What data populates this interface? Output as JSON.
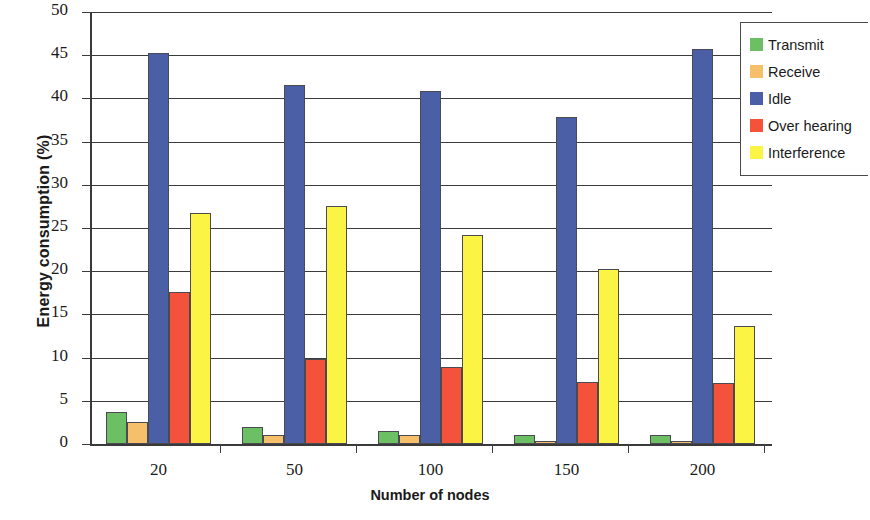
{
  "chart_data": {
    "type": "bar",
    "title": "",
    "xlabel": "Number of nodes",
    "ylabel": "Energy consumption (%)",
    "categories": [
      "20",
      "50",
      "100",
      "150",
      "200"
    ],
    "ylim": [
      0,
      50
    ],
    "yticks": [
      "0",
      "5",
      "10",
      "15",
      "20",
      "25",
      "30",
      "35",
      "40",
      "45",
      "50"
    ],
    "grid": true,
    "legend_position": "top-right",
    "series": [
      {
        "name": "Transmit",
        "color": "#6cbf63",
        "values": [
          3.7,
          2.0,
          1.5,
          1.0,
          1.0
        ]
      },
      {
        "name": "Receive",
        "color": "#f6c06a",
        "values": [
          2.5,
          1.1,
          1.0,
          0.4,
          0.4
        ]
      },
      {
        "name": "Idle",
        "color": "#4a5fa5",
        "values": [
          45.2,
          41.5,
          40.9,
          37.9,
          45.7
        ]
      },
      {
        "name": "Over hearing",
        "color": "#f4523b",
        "values": [
          17.6,
          9.8,
          8.9,
          7.2,
          7.1
        ]
      },
      {
        "name": "Interference",
        "color": "#fcf444",
        "values": [
          26.7,
          27.5,
          24.2,
          20.2,
          13.7
        ]
      }
    ]
  },
  "axis": {
    "y_title": "Energy consumption (%)",
    "x_title": "Number of nodes"
  },
  "legend": {
    "items": [
      {
        "label": "Transmit"
      },
      {
        "label": "Receive"
      },
      {
        "label": "Idle"
      },
      {
        "label": "Over hearing"
      },
      {
        "label": "Interference"
      }
    ]
  }
}
